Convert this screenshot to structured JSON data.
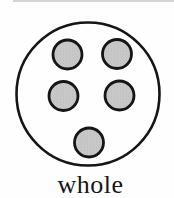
{
  "figure": {
    "label": "whole",
    "dot_count": 5,
    "colors": {
      "background": "#fefefe",
      "outline": "#151515",
      "dot_fill": "#c9c9c9",
      "dot_speckle": "#b2b2b2",
      "top_rule": "#c6c6c6",
      "label_text": "#161616"
    },
    "outer_circle": {
      "cx": 88,
      "cy": 94,
      "r": 71.5,
      "stroke_width": 2.6
    },
    "dot_style": {
      "r": 14.5,
      "stroke_width": 2.8
    },
    "dots": [
      {
        "cx": 67.5,
        "cy": 54.5
      },
      {
        "cx": 117.0,
        "cy": 54.0
      },
      {
        "cx": 63.5,
        "cy": 96.0
      },
      {
        "cx": 119.5,
        "cy": 95.5
      },
      {
        "cx": 89.0,
        "cy": 142.5
      }
    ]
  }
}
